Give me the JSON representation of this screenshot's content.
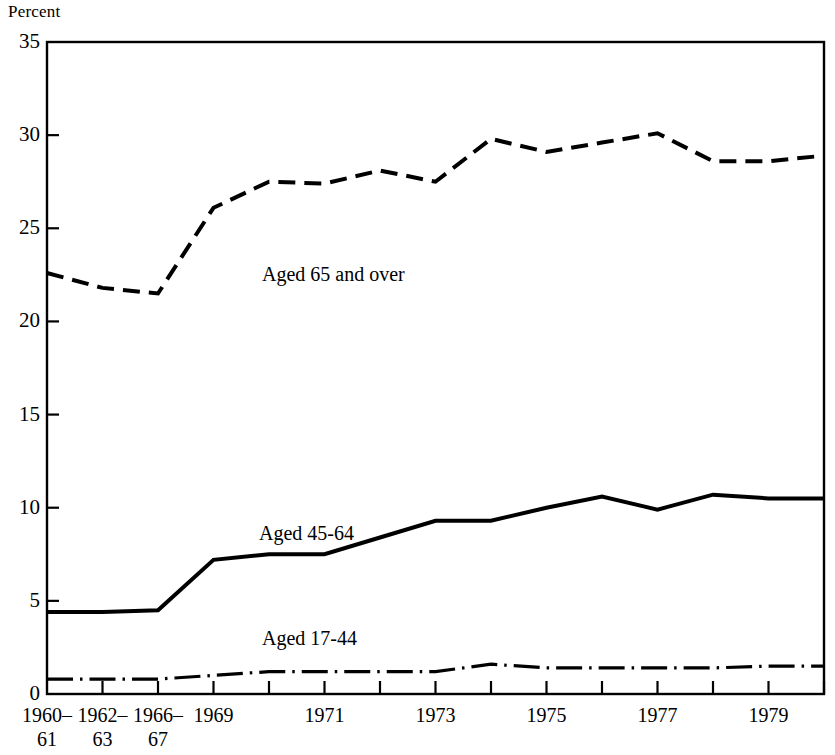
{
  "chart_data": {
    "type": "line",
    "title": "",
    "ylabel": "Percent",
    "xlabel": "",
    "ylim": [
      0,
      35
    ],
    "ytick_values": [
      0,
      5,
      10,
      15,
      20,
      25,
      30,
      35
    ],
    "ytick_labels": [
      "0",
      "5",
      "10",
      "15",
      "20",
      "25",
      "30",
      "35"
    ],
    "grid": false,
    "legend_position": "inline-annotations",
    "categories": [
      "1960–61",
      "1962–63",
      "1966–67",
      "1969",
      "1970",
      "1971",
      "1972",
      "1973",
      "1974",
      "1975",
      "1976",
      "1977",
      "1978",
      "1979",
      "1980"
    ],
    "xtick_labels": [
      {
        "line1": "1960–",
        "line2": "61",
        "show": true
      },
      {
        "line1": "1962–",
        "line2": "63",
        "show": true
      },
      {
        "line1": "1966–",
        "line2": "67",
        "show": true
      },
      {
        "line1": "1969",
        "line2": "",
        "show": true
      },
      {
        "line1": "",
        "line2": "",
        "show": false
      },
      {
        "line1": "1971",
        "line2": "",
        "show": true
      },
      {
        "line1": "",
        "line2": "",
        "show": false
      },
      {
        "line1": "1973",
        "line2": "",
        "show": true
      },
      {
        "line1": "",
        "line2": "",
        "show": false
      },
      {
        "line1": "1975",
        "line2": "",
        "show": true
      },
      {
        "line1": "",
        "line2": "",
        "show": false
      },
      {
        "line1": "1977",
        "line2": "",
        "show": true
      },
      {
        "line1": "",
        "line2": "",
        "show": false
      },
      {
        "line1": "1979",
        "line2": "",
        "show": true
      },
      {
        "line1": "",
        "line2": "",
        "show": false
      }
    ],
    "series": [
      {
        "name": "Aged 65 and over",
        "label": "Aged 65 and over",
        "style": "dashed",
        "color": "#000000",
        "values": [
          22.6,
          21.8,
          21.5,
          26.1,
          27.5,
          27.4,
          28.1,
          27.5,
          29.8,
          29.1,
          29.6,
          30.1,
          28.6,
          28.6,
          28.9
        ]
      },
      {
        "name": "Aged 45-64",
        "label": "Aged 45-64",
        "style": "solid",
        "color": "#000000",
        "values": [
          4.4,
          4.4,
          4.5,
          7.2,
          7.5,
          7.5,
          8.4,
          9.3,
          9.3,
          10.0,
          10.6,
          9.9,
          10.7,
          10.5,
          10.5
        ]
      },
      {
        "name": "Aged 17-44",
        "label": "Aged 17-44",
        "style": "dash-dot",
        "color": "#000000",
        "values": [
          0.8,
          0.8,
          0.8,
          1.0,
          1.2,
          1.2,
          1.2,
          1.2,
          1.6,
          1.4,
          1.4,
          1.4,
          1.4,
          1.5,
          1.5
        ]
      }
    ],
    "annotations": [
      {
        "text": "Aged 65 and over",
        "x_px": 262,
        "y_px": 264
      },
      {
        "text": "Aged 45-64",
        "x_px": 259,
        "y_px": 523
      },
      {
        "text": "Aged 17-44",
        "x_px": 262,
        "y_px": 628
      }
    ]
  }
}
